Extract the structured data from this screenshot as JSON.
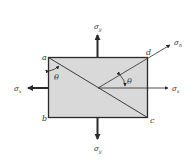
{
  "figure": {
    "type": "stress element with inclined plane",
    "colors": {
      "fill": "#d9d9d9",
      "stroke": "#2a2a2a",
      "text": "#333333",
      "background": "#ffffff"
    }
  },
  "corners": {
    "a": "a",
    "b": "b",
    "c": "c",
    "d": "d"
  },
  "stresses": {
    "sigma_y_top": {
      "symbol": "σ",
      "sub": "y"
    },
    "sigma_y_bottom": {
      "symbol": "σ",
      "sub": "y"
    },
    "sigma_x_left": {
      "symbol": "σ",
      "sub": "x"
    },
    "sigma_x_right": {
      "symbol": "σ",
      "sub": "x"
    },
    "sigma_n": {
      "symbol": "σ",
      "sub": "n"
    }
  },
  "angles": {
    "theta_left": "θ",
    "theta_right": "θ"
  }
}
